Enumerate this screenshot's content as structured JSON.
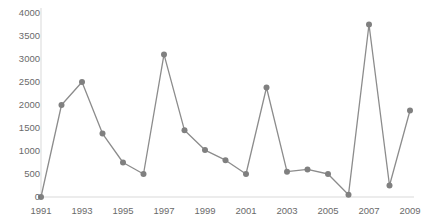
{
  "chart_data": {
    "type": "line",
    "title": "",
    "title_note": "title cropped off top edge of screenshot",
    "xlabel": "",
    "ylabel": "",
    "x": [
      1991,
      1992,
      1993,
      1994,
      1995,
      1996,
      1997,
      1998,
      1999,
      2000,
      2001,
      2002,
      2003,
      2004,
      2005,
      2006,
      2007,
      2008,
      2009
    ],
    "values": [
      0,
      2000,
      2500,
      1380,
      750,
      500,
      3100,
      1450,
      1020,
      800,
      500,
      2380,
      550,
      600,
      500,
      50,
      3750,
      250,
      1880
    ],
    "series": [
      {
        "name": "series-1",
        "values": [
          0,
          2000,
          2500,
          1380,
          750,
          500,
          3100,
          1450,
          1020,
          800,
          500,
          2380,
          550,
          600,
          500,
          50,
          3750,
          250,
          1880
        ]
      }
    ],
    "xlim": [
      1991,
      2009
    ],
    "ylim": [
      0,
      4000
    ],
    "ytick_labels": [
      "4000",
      "3500",
      "3000",
      "2500",
      "2000",
      "1500",
      "1000",
      "500",
      "0"
    ],
    "ytick_values": [
      4000,
      3500,
      3000,
      2500,
      2000,
      1500,
      1000,
      500,
      0
    ],
    "xtick_labels": [
      "1991",
      "1993",
      "1995",
      "1997",
      "1999",
      "2001",
      "2003",
      "2005",
      "2007",
      "2009"
    ],
    "xtick_values": [
      1991,
      1993,
      1995,
      1997,
      1999,
      2001,
      2003,
      2005,
      2007,
      2009
    ],
    "grid": false,
    "legend": "none",
    "marker": "circle",
    "line_color": "#8c8c8c",
    "marker_color": "#808080",
    "axis_color": "#d9d9d9",
    "tick_text_color": "#6a6a6a",
    "background_color": "#ffffff"
  }
}
